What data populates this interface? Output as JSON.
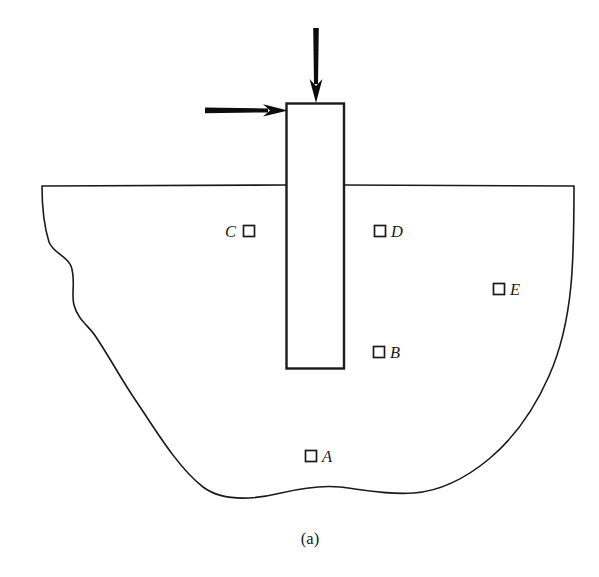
{
  "figure": {
    "caption": "(a)",
    "background_color": "#ffffff",
    "line_color": "#1a1a1a"
  },
  "ground": {
    "label": "ground-surface-line"
  },
  "pile": {
    "label": "pile-foundation"
  },
  "loads": [
    {
      "name": "vertical-load-arrow",
      "direction": "down"
    },
    {
      "name": "horizontal-load-arrow",
      "direction": "right"
    }
  ],
  "points": [
    {
      "id": "A",
      "label": "A",
      "label_side": "right"
    },
    {
      "id": "B",
      "label": "B",
      "label_side": "right"
    },
    {
      "id": "C",
      "label": "C",
      "label_side": "left"
    },
    {
      "id": "D",
      "label": "D",
      "label_side": "right"
    },
    {
      "id": "E",
      "label": "E",
      "label_side": "right"
    }
  ]
}
